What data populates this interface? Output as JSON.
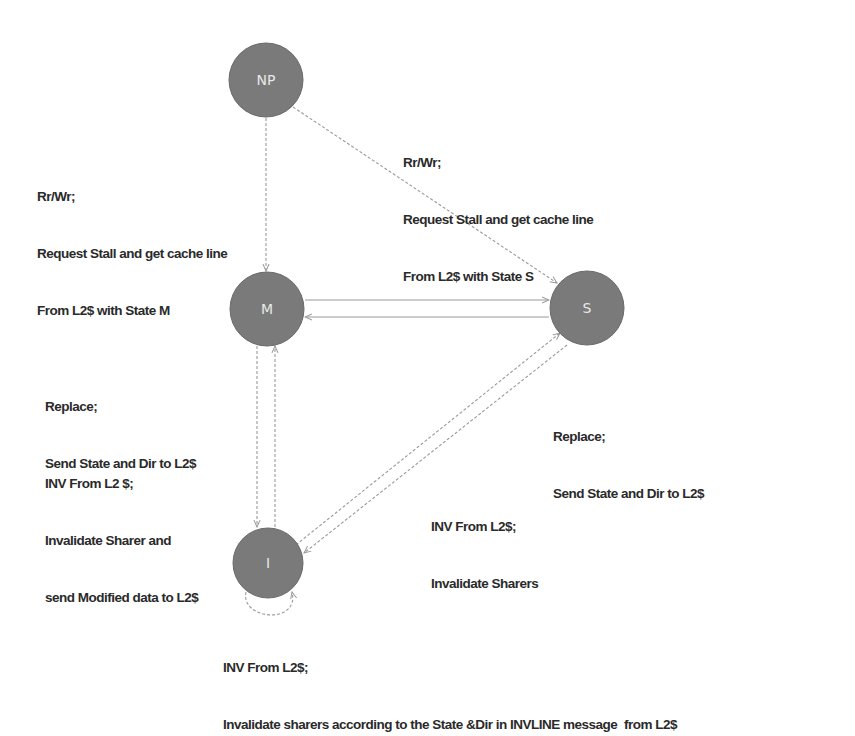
{
  "nodes": [
    {
      "id": "NP",
      "label": "NP"
    },
    {
      "id": "M",
      "label": "M"
    },
    {
      "id": "S",
      "label": "S"
    },
    {
      "id": "I",
      "label": "I"
    }
  ],
  "edges": [
    {
      "from": "NP",
      "to": "M",
      "style": "dashed"
    },
    {
      "from": "NP",
      "to": "S",
      "style": "dashed"
    },
    {
      "from": "M",
      "to": "S",
      "style": "solid"
    },
    {
      "from": "S",
      "to": "M",
      "style": "solid"
    },
    {
      "from": "M",
      "to": "I",
      "style": "dashed"
    },
    {
      "from": "I",
      "to": "M",
      "style": "dashed"
    },
    {
      "from": "I",
      "to": "S",
      "style": "dashed"
    },
    {
      "from": "S",
      "to": "I",
      "style": "dashed"
    },
    {
      "from": "I",
      "to": "I",
      "style": "dashed"
    }
  ],
  "labels": {
    "np_to_m": [
      "Rr/Wr;",
      "Request Stall and get cache line",
      "From L2$ with State M"
    ],
    "np_to_s": [
      "Rr/Wr;",
      "Request Stall and get cache line",
      "From L2$ with State S"
    ],
    "m_replace": [
      "Replace;",
      "Send State and Dir to L2$"
    ],
    "m_inv": [
      "INV From L2 $;",
      "Invalidate Sharer and",
      "send Modified data to L2$"
    ],
    "s_replace": [
      "Replace;",
      "Send State and Dir to L2$"
    ],
    "s_inv": [
      "INV From L2$;",
      "Invalidate Sharers"
    ],
    "i_self": [
      "INV From L2$;",
      "Invalidate sharers according to the State &Dir in INVLINE message  from L2$"
    ]
  }
}
